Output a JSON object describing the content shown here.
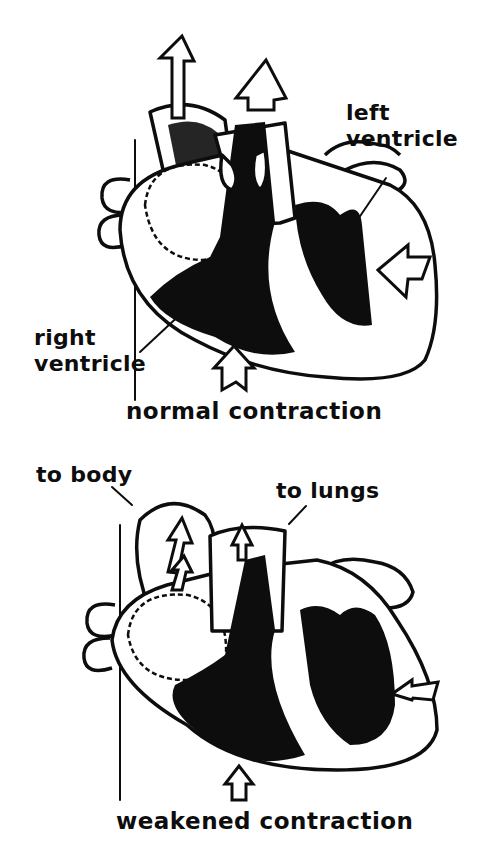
{
  "diagram": {
    "top_panel": {
      "caption": "normal contraction",
      "labels": {
        "left_ventricle_line1": "left",
        "left_ventricle_line2": "ventricle",
        "right_ventricle_line1": "right",
        "right_ventricle_line2": "ventricle"
      }
    },
    "bottom_panel": {
      "caption": "weakened contraction",
      "labels": {
        "to_body": "to body",
        "to_lungs": "to lungs"
      }
    },
    "colors": {
      "ink": "#0d0d0d",
      "paper": "#ffffff"
    }
  }
}
